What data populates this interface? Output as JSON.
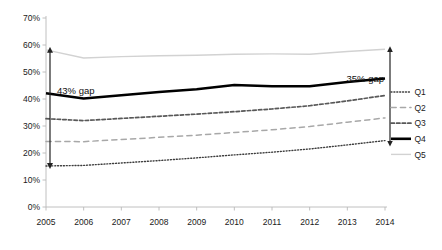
{
  "chart_data": {
    "type": "line",
    "title": "",
    "subtitle": "",
    "xlabel": "",
    "ylabel": "",
    "grid": false,
    "legend_position": "right",
    "categories": [
      "2005",
      "2006",
      "2007",
      "2008",
      "2009",
      "2010",
      "2011",
      "2012",
      "2013",
      "2014"
    ],
    "x_tick_labels": [
      "2005",
      "2006",
      "2007",
      "2008",
      "2009",
      "2010",
      "2011",
      "2012",
      "2013",
      "2014"
    ],
    "y_tick_labels": [
      "0%",
      "10%",
      "20%",
      "30%",
      "40%",
      "50%",
      "60%",
      "70%"
    ],
    "y_tick_values": [
      0,
      10,
      20,
      30,
      40,
      50,
      60,
      70
    ],
    "ylim": [
      0,
      70
    ],
    "series": [
      {
        "name": "Q1",
        "style": "dotted",
        "color": "#3d3d3d",
        "width": 1.4,
        "values": [
          15.2,
          15.4,
          16.3,
          17.2,
          18.2,
          19.3,
          20.3,
          21.5,
          23.0,
          24.6
        ]
      },
      {
        "name": "Q2",
        "style": "long-dash",
        "color": "#a8a8a8",
        "width": 1.5,
        "values": [
          24.3,
          24.2,
          25.0,
          25.8,
          26.6,
          27.6,
          28.6,
          29.8,
          31.4,
          33.0
        ]
      },
      {
        "name": "Q3",
        "style": "dash",
        "color": "#585858",
        "width": 1.7,
        "values": [
          32.7,
          32.0,
          32.8,
          33.6,
          34.4,
          35.3,
          36.3,
          37.5,
          39.3,
          41.3
        ]
      },
      {
        "name": "Q4",
        "style": "solid",
        "color": "#000000",
        "width": 2.6,
        "values": [
          42.1,
          40.2,
          41.4,
          42.6,
          43.6,
          45.2,
          44.7,
          44.7,
          46.3,
          47.6
        ]
      },
      {
        "name": "Q5",
        "style": "solid-thin",
        "color": "#d2d2d2",
        "width": 1.4,
        "values": [
          58.2,
          55.2,
          55.7,
          56.0,
          56.2,
          56.6,
          56.7,
          56.6,
          57.6,
          58.4
        ]
      }
    ],
    "annotations": [
      {
        "name": "left-gap",
        "label": "43% gap",
        "x_category": "2005",
        "from_value": 58.2,
        "to_value": 15.2,
        "gap": 43
      },
      {
        "name": "right-gap",
        "label": "35% gap",
        "x_category": "2014",
        "from_value": 58.4,
        "to_value": 23.5,
        "gap": 35
      }
    ]
  },
  "legend": {
    "items": [
      {
        "label": "Q1"
      },
      {
        "label": "Q2"
      },
      {
        "label": "Q3"
      },
      {
        "label": "Q4"
      },
      {
        "label": "Q5"
      }
    ]
  },
  "colors": {
    "axis": "#b9b9b9",
    "text": "#1a1a1a",
    "arrow": "#222222",
    "background": "#ffffff"
  }
}
